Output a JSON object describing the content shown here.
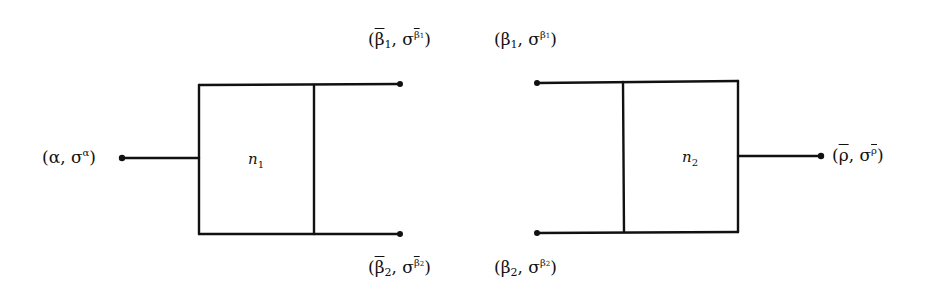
{
  "diagram": {
    "nodes": [
      {
        "id": "n1",
        "label": "n",
        "subscript": "1"
      },
      {
        "id": "n2",
        "label": "n",
        "subscript": "2"
      }
    ],
    "labels": {
      "input": {
        "base": "α",
        "sigma": "σ",
        "sup": "α",
        "text": "(α, σ^α)"
      },
      "out_top_left": {
        "base": "β",
        "sub": "1",
        "sigma": "σ",
        "sup": "β",
        "supsub": "1",
        "overbar": true,
        "text": "(β̄1, σ^β̄1)"
      },
      "out_bottom_left": {
        "base": "β",
        "sub": "2",
        "sigma": "σ",
        "sup": "β",
        "supsub": "2",
        "overbar": true,
        "text": "(β̄2, σ^β̄2)"
      },
      "in_top_right": {
        "base": "β",
        "sub": "1",
        "sigma": "σ",
        "sup": "β",
        "supsub": "1",
        "overbar": false,
        "text": "(β1, σ^β1)"
      },
      "in_bottom_right": {
        "base": "β",
        "sub": "2",
        "sigma": "σ",
        "sup": "β",
        "supsub": "2",
        "overbar": false,
        "text": "(β2, σ^β2)"
      },
      "output": {
        "base": "ρ",
        "sigma": "σ",
        "sup": "ρ",
        "overbar": true,
        "text": "(ρ̄, σ^ρ̄)"
      }
    },
    "stroke_color": "#111111",
    "background": "#ffffff"
  }
}
